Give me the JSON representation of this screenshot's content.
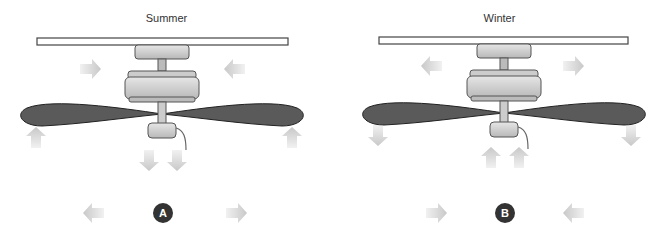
{
  "panels": [
    {
      "id": "summer",
      "title": "Summer",
      "badge": "A",
      "airflow": {
        "upper": [
          "right",
          "left"
        ],
        "blade_tips": "up",
        "center": "down",
        "floor": [
          "left",
          "right"
        ]
      }
    },
    {
      "id": "winter",
      "title": "Winter",
      "badge": "B",
      "airflow": {
        "upper": [
          "left",
          "right"
        ],
        "blade_tips": "down",
        "center": "up",
        "floor": [
          "right",
          "left"
        ]
      }
    }
  ],
  "colors": {
    "arrow": "#c8c8c8",
    "blade": "#5a5a5a",
    "housing": "#d0d0d0",
    "badge": "#333333"
  }
}
